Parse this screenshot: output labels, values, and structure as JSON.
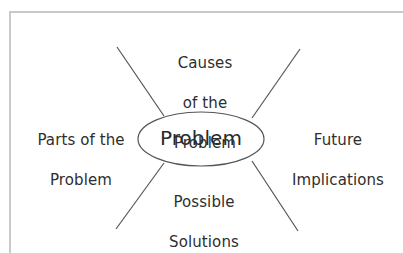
{
  "diagram": {
    "type": "concept-web",
    "center": {
      "label": "Problem"
    },
    "branches": [
      {
        "position": "top",
        "lines": [
          "Causes",
          "of the",
          "Problem"
        ]
      },
      {
        "position": "left",
        "lines": [
          "Parts of the",
          "Problem"
        ]
      },
      {
        "position": "right",
        "lines": [
          "Future",
          "Implications"
        ]
      },
      {
        "position": "bottom",
        "lines": [
          "Possible",
          "Solutions"
        ]
      }
    ],
    "colors": {
      "line": "#555555",
      "text": "#2e2e2e",
      "frame": "#c9c9c9",
      "background": "#ffffff"
    }
  }
}
